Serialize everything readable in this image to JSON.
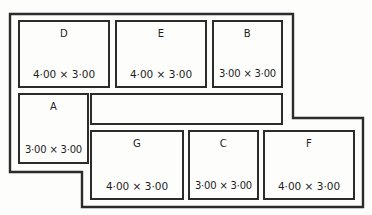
{
  "diagram": {
    "type": "packing-layout",
    "units_separator": "×",
    "stroke_color": "#2b2b2b",
    "background_color": "#fdfdfc",
    "canvas": {
      "width": 372,
      "height": 215
    },
    "outer_boundary": {
      "name": "stepped-sheet-outline",
      "points": "10,14 293,14 293,118 363,118 363,207 82,207 82,172 10,172"
    },
    "pieces": [
      {
        "id": "D",
        "label": "D",
        "dimensions": "4·00  ×  3·00",
        "x": 18,
        "y": 20,
        "width": 92,
        "height": 68,
        "empty": false,
        "tight": false
      },
      {
        "id": "E",
        "label": "E",
        "dimensions": "4·00  ×  3·00",
        "x": 115,
        "y": 20,
        "width": 92,
        "height": 68,
        "empty": false,
        "tight": false
      },
      {
        "id": "B",
        "label": "B",
        "dimensions": "3·00 × 3·00",
        "x": 212,
        "y": 20,
        "width": 71,
        "height": 68,
        "empty": false,
        "tight": true
      },
      {
        "id": "A",
        "label": "A",
        "dimensions": "3·00 × 3·00",
        "x": 18,
        "y": 93,
        "width": 71,
        "height": 71,
        "empty": false,
        "tight": true
      },
      {
        "id": "empty-1",
        "label": "",
        "dimensions": "",
        "x": 90,
        "y": 93,
        "width": 193,
        "height": 32,
        "empty": true,
        "tight": false
      },
      {
        "id": "G",
        "label": "G",
        "dimensions": "4·00  ×  3·00",
        "x": 90,
        "y": 130,
        "width": 94,
        "height": 70,
        "empty": false,
        "tight": false
      },
      {
        "id": "C",
        "label": "C",
        "dimensions": "3·00 × 3·00",
        "x": 188,
        "y": 130,
        "width": 71,
        "height": 70,
        "empty": false,
        "tight": true
      },
      {
        "id": "F",
        "label": "F",
        "dimensions": "4·00  ×  3·00",
        "x": 263,
        "y": 130,
        "width": 92,
        "height": 70,
        "empty": false,
        "tight": false
      }
    ]
  }
}
